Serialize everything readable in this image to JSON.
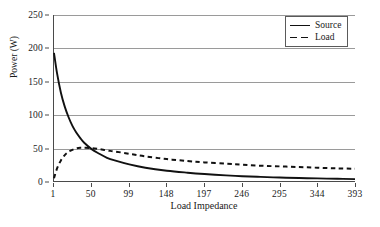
{
  "chart_data": {
    "type": "line",
    "title": "",
    "xlabel": "Load Impedance",
    "ylabel": "Power (W)",
    "xlim": [
      1,
      393
    ],
    "ylim": [
      0,
      250
    ],
    "xticks": [
      1,
      50,
      99,
      148,
      197,
      246,
      295,
      344,
      393
    ],
    "yticks": [
      0,
      50,
      100,
      150,
      200,
      250
    ],
    "grid": "horizontal",
    "legend_position": "top-right",
    "x": [
      1,
      5,
      10,
      15,
      20,
      25,
      30,
      35,
      40,
      50,
      60,
      70,
      80,
      99,
      120,
      148,
      175,
      197,
      225,
      246,
      270,
      295,
      320,
      344,
      370,
      393
    ],
    "series": [
      {
        "name": "Source",
        "style": "solid",
        "color": "#111111",
        "values": [
          193,
          162,
          133,
          112,
          96,
          83,
          73,
          65,
          58,
          48,
          41,
          35,
          31,
          25,
          20,
          15.5,
          12.5,
          10.5,
          8.5,
          7.2,
          6.2,
          5.2,
          4.5,
          3.9,
          3.3,
          2.9
        ]
      },
      {
        "name": "Load",
        "style": "dashed",
        "color": "#111111",
        "values": [
          4,
          19,
          31,
          39,
          44,
          47,
          49,
          50,
          50,
          49.5,
          48,
          46,
          44.5,
          41,
          37,
          33,
          30,
          28,
          26,
          24.5,
          23,
          22,
          21,
          20,
          19,
          18.5
        ]
      }
    ]
  },
  "legend": {
    "entries": [
      {
        "label": "Source",
        "style": "solid"
      },
      {
        "label": "Load",
        "style": "dashed"
      }
    ]
  },
  "axes": {
    "y_title": "Power (W)",
    "x_title": "Load Impedance",
    "y_tick_labels": [
      "0",
      "50",
      "100",
      "150",
      "200",
      "250"
    ],
    "x_tick_labels": [
      "1",
      "50",
      "99",
      "148",
      "197",
      "246",
      "295",
      "344",
      "393"
    ]
  }
}
